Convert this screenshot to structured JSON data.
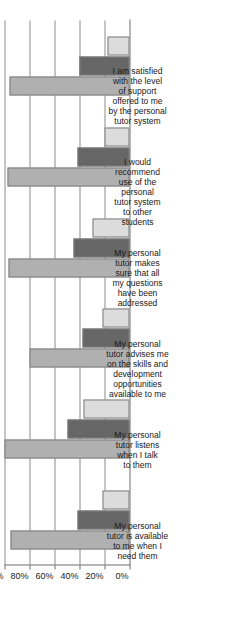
{
  "chart_data": {
    "type": "bar",
    "title": "",
    "subtitle": "",
    "xlabel": "",
    "ylabel": "",
    "ylim": [
      0,
      100
    ],
    "grid": true,
    "legend_position": "none",
    "orientation": "rotated-90-horizontal-bars",
    "tick_labels": [
      "100%",
      "80%",
      "60%",
      "40%",
      "20%",
      "0%"
    ],
    "tick_values": [
      100,
      80,
      60,
      40,
      20,
      0
    ],
    "categories": [
      "My personal\ntutor is available\nto me when I\nneed them",
      "My personal\ntutor listens\nwhen I talk\nto them",
      "My personal\ntutor advises me\non the skills and\ndevelopment\nopportunities\navailable to me",
      "My personal\ntutor makes\nsure that all\nmy questions\nhave been\naddressed",
      "I would\nrecommend\nuse of the\npersonal\ntutor system\nto other\nstudents",
      "I am satisfied\nwith the level\nof support\noffered to me\nby the personal\ntutor system"
    ],
    "series": [
      {
        "name": "series-1",
        "color": "#b0b0b0",
        "values": [
          95,
          100,
          80,
          97,
          98,
          96
        ]
      },
      {
        "name": "series-2",
        "color": "#666666",
        "values": [
          42,
          50,
          38,
          45,
          42,
          40
        ]
      },
      {
        "name": "series-3",
        "color": "#dcdcdc",
        "values": [
          22,
          37,
          22,
          30,
          20,
          18
        ]
      }
    ]
  },
  "colors": {
    "series_1": "#b0b0b0",
    "series_2": "#666666",
    "series_3": "#dcdcdc",
    "bar_outline": "#7d7d7d",
    "gridline": "#8c8c8c",
    "axis": "#6e6e6e",
    "text": "#1a1a1a",
    "background": "#ffffff"
  }
}
